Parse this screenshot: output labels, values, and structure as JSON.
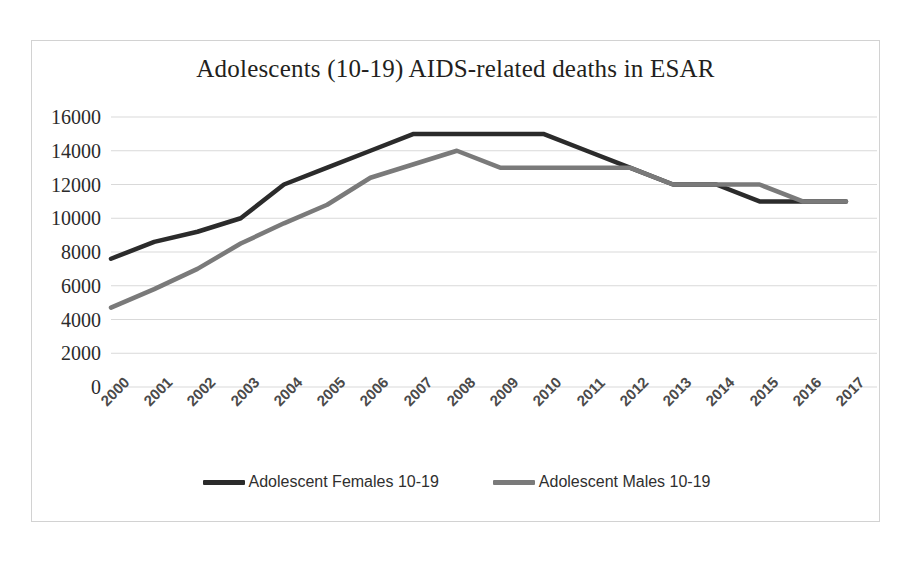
{
  "chart_data": {
    "type": "line",
    "title": "Adolescents (10-19) AIDS-related deaths in ESAR",
    "xlabel": "",
    "ylabel": "",
    "categories": [
      "2000",
      "2001",
      "2002",
      "2003",
      "2004",
      "2005",
      "2006",
      "2007",
      "2008",
      "2009",
      "2010",
      "2011",
      "2012",
      "2013",
      "2014",
      "2015",
      "2016",
      "2017"
    ],
    "ylim": [
      0,
      16000
    ],
    "ytick_values": [
      0,
      2000,
      4000,
      6000,
      8000,
      10000,
      12000,
      14000,
      16000
    ],
    "ytick_labels": [
      "0",
      "2000",
      "4000",
      "6000",
      "8000",
      "10000",
      "12000",
      "14000",
      "16000"
    ],
    "grid": true,
    "legend_position": "bottom",
    "series": [
      {
        "name": "Adolescent Females 10-19",
        "color": "#2b2b2b",
        "values": [
          7600,
          8600,
          9200,
          10000,
          12000,
          13000,
          14000,
          15000,
          15000,
          15000,
          15000,
          14000,
          13000,
          12000,
          12000,
          11000,
          11000,
          11000
        ]
      },
      {
        "name": "Adolescent Males 10-19",
        "color": "#7a7a7a",
        "values": [
          4700,
          5800,
          7000,
          8500,
          9700,
          10800,
          12400,
          13200,
          14000,
          13000,
          13000,
          13000,
          13000,
          12000,
          12000,
          12000,
          11000,
          11000
        ]
      }
    ]
  },
  "card": {
    "border_color": "#d2d2d2",
    "background": "#ffffff"
  }
}
